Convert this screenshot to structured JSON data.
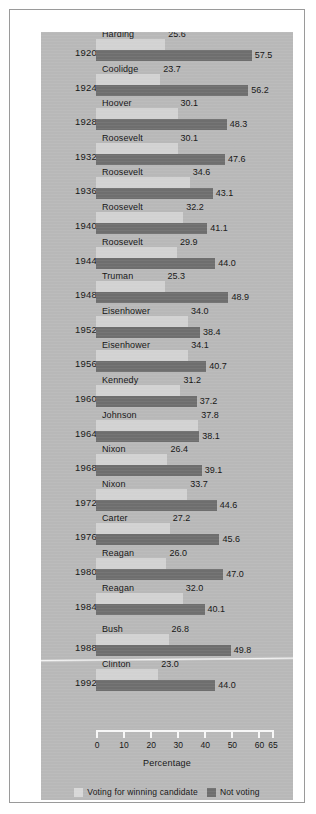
{
  "chart_data": {
    "type": "bar",
    "orientation": "horizontal",
    "title": "",
    "subtitle": "",
    "xlabel": "Percentage",
    "ylabel": "Election Year",
    "xlim": [
      0,
      65
    ],
    "xticks": [
      0,
      10,
      20,
      30,
      40,
      50,
      60,
      65
    ],
    "xtick_labels": [
      "0",
      "10",
      "20",
      "30",
      "40",
      "50",
      "60",
      "65"
    ],
    "grid": false,
    "legend_position": "bottom",
    "legend": [
      {
        "label": "Voting for winning candidate",
        "color": "#d8d8d8"
      },
      {
        "label": "Not voting",
        "color": "#6e6e6e"
      }
    ],
    "categories": [
      "1920",
      "1924",
      "1928",
      "1932",
      "1936",
      "1940",
      "1944",
      "1948",
      "1952",
      "1956",
      "1960",
      "1964",
      "1968",
      "1972",
      "1976",
      "1980",
      "1984",
      "1988",
      "1992"
    ],
    "series": [
      {
        "name": "Voting for winning candidate",
        "color": "#d8d8d8",
        "values": [
          25.6,
          23.7,
          30.1,
          30.1,
          34.6,
          32.2,
          29.9,
          25.3,
          34.0,
          34.1,
          31.2,
          37.8,
          26.4,
          33.7,
          27.2,
          26.0,
          32.0,
          26.8,
          23.0
        ]
      },
      {
        "name": "Not voting",
        "color": "#6e6e6e",
        "values": [
          57.5,
          56.2,
          48.3,
          47.6,
          43.1,
          41.1,
          44.0,
          48.9,
          38.4,
          40.7,
          37.2,
          38.1,
          39.1,
          44.6,
          45.6,
          47.0,
          40.1,
          49.8,
          44.0
        ]
      }
    ],
    "annotations": [
      {
        "text": "Harding",
        "year": "1920",
        "winner_value": "25.6",
        "notvoting_value": "57.5"
      },
      {
        "text": "Coolidge",
        "year": "1924",
        "winner_value": "23.7",
        "notvoting_value": "56.2"
      },
      {
        "text": "Hoover",
        "year": "1928",
        "winner_value": "30.1",
        "notvoting_value": "48.3"
      },
      {
        "text": "Roosevelt",
        "year": "1932",
        "winner_value": "30.1",
        "notvoting_value": "47.6"
      },
      {
        "text": "Roosevelt",
        "year": "1936",
        "winner_value": "34.6",
        "notvoting_value": "43.1"
      },
      {
        "text": "Roosevelt",
        "year": "1940",
        "winner_value": "32.2",
        "notvoting_value": "41.1"
      },
      {
        "text": "Roosevelt",
        "year": "1944",
        "winner_value": "29.9",
        "notvoting_value": "44.0"
      },
      {
        "text": "Truman",
        "year": "1948",
        "winner_value": "25.3",
        "notvoting_value": "48.9"
      },
      {
        "text": "Eisenhower",
        "year": "1952",
        "winner_value": "34.0",
        "notvoting_value": "38.4"
      },
      {
        "text": "Eisenhower",
        "year": "1956",
        "winner_value": "34.1",
        "notvoting_value": "40.7"
      },
      {
        "text": "Kennedy",
        "year": "1960",
        "winner_value": "31.2",
        "notvoting_value": "37.2"
      },
      {
        "text": "Johnson",
        "year": "1964",
        "winner_value": "37.8",
        "notvoting_value": "38.1"
      },
      {
        "text": "Nixon",
        "year": "1968",
        "winner_value": "26.4",
        "notvoting_value": "39.1"
      },
      {
        "text": "Nixon",
        "year": "1972",
        "winner_value": "33.7",
        "notvoting_value": "44.6"
      },
      {
        "text": "Carter",
        "year": "1976",
        "winner_value": "27.2",
        "notvoting_value": "45.6"
      },
      {
        "text": "Reagan",
        "year": "1980",
        "winner_value": "26.0",
        "notvoting_value": "47.0"
      },
      {
        "text": "Reagan",
        "year": "1984",
        "winner_value": "32.0",
        "notvoting_value": "40.1"
      },
      {
        "text": "Bush",
        "year": "1988",
        "winner_value": "26.8",
        "notvoting_value": "49.8"
      },
      {
        "text": "Clinton",
        "year": "1992",
        "winner_value": "23.0",
        "notvoting_value": "44.0"
      }
    ],
    "separator_after_category": "1984",
    "panel_background": "#b8b8b8",
    "axis_color": "#f7f7f7"
  }
}
